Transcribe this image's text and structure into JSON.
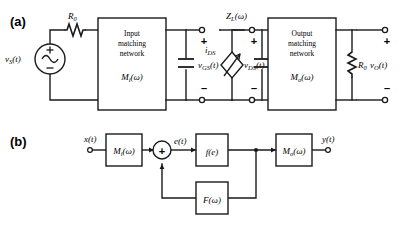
{
  "figure": {
    "panel_a_label": "(a)",
    "panel_b_label": "(b)"
  },
  "circuit_a": {
    "source_label": "v",
    "source_sub": "S",
    "source_suffix": "(t)",
    "source_plus": "+",
    "source_minus": "–",
    "series_resistor": "R",
    "series_resistor_sub": "0",
    "input_block": {
      "line1": "Input",
      "line2": "matching",
      "line3": "network",
      "transfer": "M",
      "transfer_sub": "i",
      "transfer_arg": "(ω)"
    },
    "gate_voltage": "v",
    "gate_voltage_sub": "GS",
    "gate_voltage_suffix": "(t)",
    "gate_plus": "+",
    "gate_minus": "–",
    "drain_current": "i",
    "drain_current_sub": "DS",
    "drain_voltage": "v",
    "drain_voltage_sub": "DS",
    "drain_voltage_suffix": "(t)",
    "drain_plus": "+",
    "drain_minus": "–",
    "load_impedance": "Z",
    "load_impedance_sub": "L",
    "load_impedance_arg": "(ω)",
    "output_block": {
      "line1": "Output",
      "line2": "matching",
      "line3": "network",
      "transfer": "M",
      "transfer_sub": "o",
      "transfer_arg": "(ω)"
    },
    "load_resistor": "R",
    "load_resistor_sub": "0",
    "output_voltage": "v",
    "output_voltage_sub": "O",
    "output_voltage_suffix": "(t)",
    "output_plus": "+",
    "output_minus": "–"
  },
  "diagram_b": {
    "input_signal": "x(t)",
    "input_block": "M",
    "input_block_sub": "i",
    "input_block_arg": "(ω)",
    "summer_sign": "+",
    "error_signal": "e(t)",
    "nonlinear_block": "f(e)",
    "feedback_block": "F",
    "feedback_block_arg": "(ω)",
    "output_block": "M",
    "output_block_sub": "o",
    "output_block_arg": "(ω)",
    "output_signal": "y(t)"
  },
  "colors": {
    "stroke": "#1a1a1a",
    "background": "#ffffff"
  }
}
